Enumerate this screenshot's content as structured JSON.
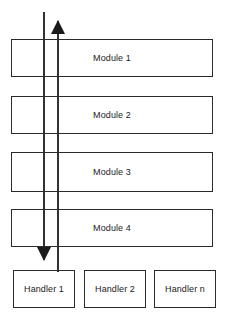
{
  "diagram": {
    "background_color": "#ffffff",
    "stroke_color": "#2b2b2b",
    "text_color": "#1b1b1b",
    "modules": [
      {
        "label": "Module 1",
        "x": 11,
        "y": 39,
        "width": 202,
        "height": 38
      },
      {
        "label": "Module 2",
        "x": 11,
        "y": 96,
        "width": 202,
        "height": 38
      },
      {
        "label": "Module 3",
        "x": 11,
        "y": 152,
        "width": 202,
        "height": 40
      },
      {
        "label": "Module 4",
        "x": 11,
        "y": 209,
        "width": 202,
        "height": 38
      }
    ],
    "handlers": [
      {
        "label": "Handler 1",
        "x": 13,
        "y": 270,
        "width": 62,
        "height": 38
      },
      {
        "label": "Handler 2",
        "x": 84,
        "y": 270,
        "width": 62,
        "height": 38
      },
      {
        "label": "Handler n",
        "x": 154,
        "y": 270,
        "width": 62,
        "height": 38
      }
    ],
    "arrows": [
      {
        "name": "downward-call-arrow",
        "direction": "down",
        "x": 44,
        "y_start": 12,
        "y_end": 268
      },
      {
        "name": "upward-return-arrow",
        "direction": "up",
        "x": 58,
        "y_start": 272,
        "y_end": 13
      }
    ]
  }
}
